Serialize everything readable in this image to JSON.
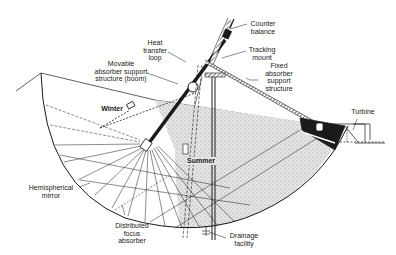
{
  "diagram": {
    "title": "",
    "labels": {
      "counter_balance": "Counter\nbalance",
      "heat_transfer_loop": "Heat\ntransfer\nloop",
      "tracking_mount": "Tracking\nmount",
      "movable_boom": "Movable\nabsorber support\nstructure (boom)",
      "fixed_support": "Fixed\nabsorber\nsupport\nstructure",
      "winter": "Winter",
      "summer": "Summer",
      "turbine": "Turbine",
      "hemispherical_mirror": "Hemispherical\nmirror",
      "distributed_focus_absorber": "Distributed\nfocus\nabsorber",
      "drainage_facility": "Drainage\nfacility"
    },
    "colors": {
      "ink": "#1a1a1a",
      "fill_speckle": "#d9d9d9",
      "background": "#ffffff"
    }
  }
}
